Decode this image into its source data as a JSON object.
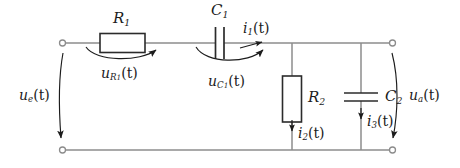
{
  "diagram": {
    "type": "electrical-schematic",
    "background_color": "#ffffff",
    "wire_color": "#8c8c8c",
    "component_outline_color": "#2b2b2b",
    "label_color": "#1c1c1c"
  },
  "labels": {
    "r1": {
      "base": "R",
      "sub": "1",
      "full": "R1"
    },
    "c1": {
      "base": "C",
      "sub": "1",
      "full": "C1"
    },
    "r2": {
      "base": "R",
      "sub": "2",
      "full": "R2"
    },
    "c2": {
      "base": "C",
      "sub": "2",
      "full": "C2"
    },
    "u_e": {
      "base": "u",
      "sub": "e",
      "arg": "(t)",
      "full": "u_e(t)"
    },
    "u_a": {
      "base": "u",
      "sub": "a",
      "arg": "(t)",
      "full": "u_a(t)"
    },
    "u_r1": {
      "base": "u",
      "sub": "R",
      "sub2": "1",
      "arg": "(t)",
      "full": "u_R1(t)"
    },
    "u_c1": {
      "base": "u",
      "sub": "C",
      "sub2": "1",
      "arg": "(t)",
      "full": "u_C1(t)"
    },
    "i1": {
      "base": "i",
      "sub": "1",
      "arg": "(t)",
      "full": "i1(t)"
    },
    "i2": {
      "base": "i",
      "sub": "2",
      "arg": "(t)",
      "full": "i2(t)"
    },
    "i3": {
      "base": "i",
      "sub": "3",
      "arg": "(t)",
      "full": "i3(t)"
    }
  },
  "components": [
    {
      "name": "resistor-r1",
      "kind": "resistor",
      "label": "R1",
      "orientation": "horizontal"
    },
    {
      "name": "capacitor-c1",
      "kind": "capacitor",
      "label": "C1",
      "orientation": "vertical-plates"
    },
    {
      "name": "resistor-r2",
      "kind": "resistor",
      "label": "R2",
      "orientation": "vertical"
    },
    {
      "name": "capacitor-c2",
      "kind": "capacitor",
      "label": "C2",
      "orientation": "horizontal-plates"
    }
  ],
  "terminals": [
    {
      "name": "input-terminal-top",
      "x": 62,
      "y": 43
    },
    {
      "name": "input-terminal-bottom",
      "x": 62,
      "y": 150
    },
    {
      "name": "output-terminal-top",
      "x": 393,
      "y": 43
    },
    {
      "name": "output-terminal-bottom",
      "x": 393,
      "y": 150
    }
  ],
  "arrows": [
    {
      "name": "voltage-arrow-ue",
      "label": "u_e(t)",
      "direction": "down"
    },
    {
      "name": "voltage-arrow-ua",
      "label": "u_a(t)",
      "direction": "down"
    },
    {
      "name": "voltage-arrow-ur1",
      "label": "u_R1(t)",
      "direction": "right"
    },
    {
      "name": "voltage-arrow-uc1",
      "label": "u_C1(t)",
      "direction": "right"
    },
    {
      "name": "current-arrow-i1",
      "label": "i1(t)",
      "direction": "right"
    },
    {
      "name": "current-arrow-i2",
      "label": "i2(t)",
      "direction": "down"
    },
    {
      "name": "current-arrow-i3",
      "label": "i3(t)",
      "direction": "down"
    }
  ]
}
